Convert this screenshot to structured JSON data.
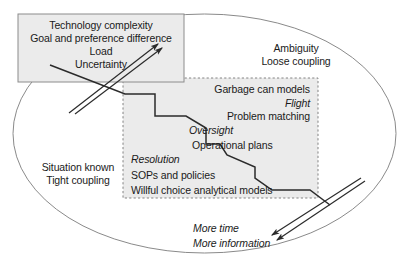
{
  "figure": {
    "type": "conceptual-diagram",
    "background_color": "#ffffff",
    "ellipse": {
      "name": "outer-ellipse",
      "stroke": "#8a8a8a",
      "fill": "none",
      "cx": 204.5,
      "cy": 133.5,
      "rx": 191.5,
      "ry": 119.5
    },
    "solid_box": {
      "name": "uncertainty-box",
      "fill": "#ebebeb",
      "stroke": "#8c8c8c",
      "border_style": "solid",
      "x": 18,
      "y": 14,
      "w": 166,
      "h": 68
    },
    "dashed_box": {
      "name": "decision-modes-box",
      "fill": "#ebebeb",
      "stroke": "#777777",
      "border_style": "dashed",
      "x": 123,
      "y": 78,
      "w": 195,
      "h": 120
    }
  },
  "labels": {
    "uncertainty_box": [
      {
        "text": "Technology complexity",
        "x": 101,
        "y": 19,
        "align": "center",
        "italic": false
      },
      {
        "text": "Goal and preference difference",
        "x": 101,
        "y": 32,
        "align": "center",
        "italic": false
      },
      {
        "text": "Load",
        "x": 101,
        "y": 45,
        "align": "center",
        "italic": false
      },
      {
        "text": "Uncertainty",
        "x": 101,
        "y": 58,
        "align": "center",
        "italic": false
      }
    ],
    "decision_box": [
      {
        "text": "Garbage can models",
        "x": 310,
        "y": 83,
        "align": "right",
        "italic": false
      },
      {
        "text": "Flight",
        "x": 310,
        "y": 97,
        "align": "right",
        "italic": true
      },
      {
        "text": "Problem matching",
        "x": 310,
        "y": 110,
        "align": "right",
        "italic": false
      },
      {
        "text": "Oversight",
        "x": 189,
        "y": 124,
        "align": "left",
        "italic": true
      },
      {
        "text": "Operational plans",
        "x": 192,
        "y": 139,
        "align": "left",
        "italic": false
      },
      {
        "text": "Resolution",
        "x": 131,
        "y": 153,
        "align": "left",
        "italic": true
      },
      {
        "text": "SOPs and policies",
        "x": 131,
        "y": 169,
        "align": "left",
        "italic": false
      },
      {
        "text": "Willful choice analytical models",
        "x": 131,
        "y": 184,
        "align": "left",
        "italic": false
      }
    ],
    "ellipse_region": [
      {
        "text": "Ambiguity",
        "x": 296,
        "y": 42,
        "align": "center",
        "italic": false
      },
      {
        "text": "Loose coupling",
        "x": 296,
        "y": 55,
        "align": "center",
        "italic": false
      },
      {
        "text": "Situation known",
        "x": 78,
        "y": 161,
        "align": "center",
        "italic": false
      },
      {
        "text": "Tight coupling",
        "x": 78,
        "y": 174,
        "align": "center",
        "italic": false
      },
      {
        "text": "More time",
        "x": 193,
        "y": 222,
        "align": "left",
        "italic": true
      },
      {
        "text": "More information",
        "x": 193,
        "y": 237,
        "align": "left",
        "italic": true
      }
    ]
  },
  "connectors": {
    "up_arrows": {
      "name": "uncertainty-arrows",
      "count": 2,
      "direction": "up-right",
      "stroke": "#2b2b2b",
      "lines": [
        {
          "x1": 69,
          "y1": 113,
          "x2": 158,
          "y2": 44
        },
        {
          "x1": 75,
          "y1": 114,
          "x2": 162,
          "y2": 48
        }
      ]
    },
    "down_arrows": {
      "name": "more-time-information-arrows",
      "count": 2,
      "direction": "down-left",
      "stroke": "#2b2b2b",
      "lines": [
        {
          "x1": 361,
          "y1": 178,
          "x2": 272,
          "y2": 235
        },
        {
          "x1": 365,
          "y1": 181,
          "x2": 277,
          "y2": 240
        }
      ]
    },
    "staircase": {
      "name": "diagonal-staircase-line",
      "stroke": "#2b2b2b",
      "points": "50,65 125,94 155,94 155,116 186,116 206,128 206,144 220,144 227,155 255,167 255,178 272,190 310,190 330,205"
    }
  }
}
